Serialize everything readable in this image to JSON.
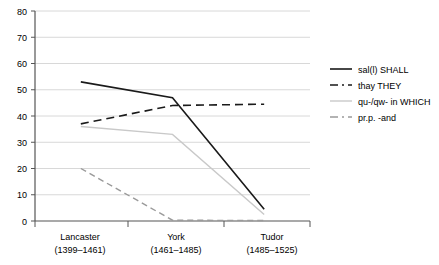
{
  "chart_data": {
    "type": "line",
    "title": "",
    "subtitle": "",
    "xlabel": "",
    "ylabel": "",
    "ylim": [
      0,
      80
    ],
    "yticks": [
      0,
      10,
      20,
      30,
      40,
      50,
      60,
      70,
      80
    ],
    "ytick_labels": [
      "0",
      "10",
      "20",
      "30",
      "40",
      "50",
      "60",
      "70",
      "80"
    ],
    "grid": true,
    "grid_axis": "y",
    "legend_position": "right",
    "categories": [
      "Lancaster",
      "York",
      "Tudor"
    ],
    "category_sublabels": [
      "(1399–1461)",
      "(1461–1485)",
      "(1485–1525)"
    ],
    "category_labels": [
      {
        "name": "Lancaster",
        "period": "(1399–1461)"
      },
      {
        "name": "York",
        "period": "(1461–1485)"
      },
      {
        "name": "Tudor",
        "period": "(1485–1525)"
      }
    ],
    "series": [
      {
        "name": "sal(l) SHALL",
        "values": [
          53,
          47,
          4.5
        ],
        "color": "#1a1a1a",
        "style": "solid",
        "width": 1.6
      },
      {
        "name": "thay THEY",
        "values": [
          37,
          44,
          44.5
        ],
        "color": "#1a1a1a",
        "style": "dashed",
        "width": 1.6
      },
      {
        "name": "qu-/qw- in WHICH",
        "values": [
          36,
          33,
          2.5
        ],
        "color": "#c9c9c9",
        "style": "solid",
        "width": 1.4
      },
      {
        "name": "pr.p. -and",
        "values": [
          20,
          0.3,
          0.2
        ],
        "color": "#9a9a9a",
        "style": "dashed",
        "width": 1.4
      }
    ]
  },
  "legend": {
    "items": [
      {
        "label": "sal(l) SHALL",
        "swatch": "solid-dark-line-swatch"
      },
      {
        "label": "thay THEY",
        "swatch": "dashed-dark-line-swatch"
      },
      {
        "label": "qu-/qw- in WHICH",
        "swatch": "solid-light-line-swatch"
      },
      {
        "label": "pr.p. -and",
        "swatch": "dashed-gray-line-swatch"
      }
    ]
  },
  "axes": {
    "y": {
      "labels": [
        "80",
        "70",
        "60",
        "50",
        "40",
        "30",
        "20",
        "10",
        "0"
      ]
    },
    "x": {
      "labels": [
        "Lancaster",
        "York",
        "Tudor"
      ],
      "sublabels": [
        "(1399–1461)",
        "(1461–1485)",
        "(1485–1525)"
      ]
    }
  },
  "colors": {
    "axis": "#555555",
    "grid": "#d8d8d8",
    "dark_series": "#1a1a1a",
    "light_series": "#c9c9c9",
    "gray_series": "#9a9a9a",
    "background": "#ffffff"
  }
}
